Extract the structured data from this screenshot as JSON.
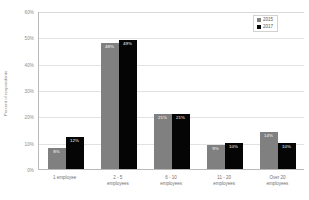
{
  "chart_data": {
    "type": "bar",
    "title": "",
    "subtitle": "",
    "xlabel": "",
    "ylabel": "Percent of respondents",
    "ylim": [
      0,
      60
    ],
    "ytick_labels": [
      "60%",
      "50%",
      "40%",
      "30%",
      "20%",
      "10%",
      "0%"
    ],
    "ytick_values": [
      60,
      50,
      40,
      30,
      20,
      10,
      0
    ],
    "grid": true,
    "legend_position": "top-right",
    "categories": [
      "1 employee",
      "2 - 5 employees",
      "6 - 10 employees",
      "11 - 20 employees",
      "Over 20 employees"
    ],
    "category_lines": [
      [
        "1 employee",
        ""
      ],
      [
        "2 - 5",
        "employees"
      ],
      [
        "6 - 10",
        "employees"
      ],
      [
        "11 - 20",
        "employees"
      ],
      [
        "Over 20",
        "employees"
      ]
    ],
    "series": [
      {
        "name": "2015",
        "color": "#808080",
        "values": [
          8,
          48,
          21,
          9,
          14
        ],
        "labels": [
          "8%",
          "48%",
          "21%",
          "9%",
          "14%"
        ]
      },
      {
        "name": "2017",
        "color": "#050505",
        "values": [
          12,
          49,
          21,
          10,
          10
        ],
        "labels": [
          "12%",
          "49%",
          "21%",
          "10%",
          "10%"
        ]
      }
    ]
  },
  "colors": {
    "series_2015": "#808080",
    "series_2017": "#050505",
    "gridline": "#e2e2e2",
    "axis": "#b9b9b9",
    "tick_text": "#8a8a8a",
    "data_label": "#ffffff",
    "background": "#ffffff"
  }
}
